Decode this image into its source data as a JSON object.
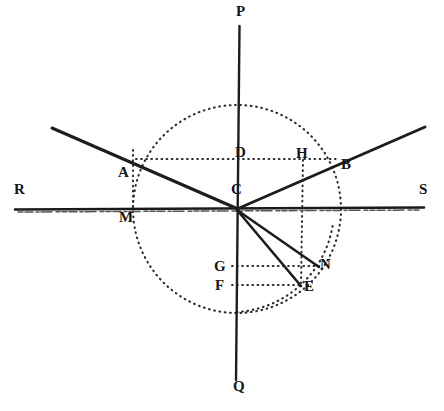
{
  "figure": {
    "type": "optics-geometry-diagram",
    "title": "",
    "canvas": {
      "width": 444,
      "height": 411,
      "background": "#ffffff"
    },
    "colors": {
      "ink": "#1a1a1a",
      "solid_line": "#1d1d1d",
      "dotted_line": "#2a2a2a",
      "surface": "#1a1a1a"
    },
    "points": {
      "C": {
        "x": 237,
        "y": 209,
        "label": "C",
        "label_x": 232,
        "label_y": 183
      },
      "P": {
        "x": 239,
        "y": 25,
        "label": "P",
        "label_x": 236,
        "label_y": 6
      },
      "Q": {
        "x": 236,
        "y": 380,
        "label": "Q",
        "label_x": 233,
        "label_y": 381
      },
      "R": {
        "x": 15,
        "y": 209,
        "label": "R",
        "label_x": 14,
        "label_y": 183
      },
      "S": {
        "x": 424,
        "y": 207,
        "label": "S",
        "label_x": 420,
        "label_y": 183
      },
      "A": {
        "x": 133,
        "y": 162,
        "label": "A",
        "label_x": 119,
        "label_y": 166
      },
      "B": {
        "x": 337,
        "y": 160,
        "label": "B",
        "label_x": 341,
        "label_y": 158
      },
      "D": {
        "x": 237,
        "y": 158,
        "label": "D",
        "label_x": 236,
        "label_y": 146
      },
      "H": {
        "x": 303,
        "y": 158,
        "label": "H",
        "label_x": 296,
        "label_y": 147
      },
      "M": {
        "x": 133,
        "y": 209,
        "label": "M",
        "label_x": 120,
        "label_y": 211
      },
      "G": {
        "x": 237,
        "y": 266,
        "label": "G",
        "label_x": 215,
        "label_y": 261
      },
      "F": {
        "x": 237,
        "y": 285,
        "label": "F",
        "label_x": 216,
        "label_y": 280
      },
      "N": {
        "x": 318,
        "y": 266,
        "label": "N",
        "label_x": 321,
        "label_y": 258
      },
      "E": {
        "x": 300,
        "y": 285,
        "label": "E",
        "label_x": 305,
        "label_y": 281
      }
    },
    "labels": [
      {
        "name": "point-label-P",
        "text": "P"
      },
      {
        "name": "point-label-Q",
        "text": "Q"
      },
      {
        "name": "point-label-R",
        "text": "R"
      },
      {
        "name": "point-label-S",
        "text": "S"
      },
      {
        "name": "point-label-A",
        "text": "A"
      },
      {
        "name": "point-label-B",
        "text": "B"
      },
      {
        "name": "point-label-C",
        "text": "C"
      },
      {
        "name": "point-label-D",
        "text": "D"
      },
      {
        "name": "point-label-E",
        "text": "E"
      },
      {
        "name": "point-label-F",
        "text": "F"
      },
      {
        "name": "point-label-G",
        "text": "G"
      },
      {
        "name": "point-label-H",
        "text": "H"
      },
      {
        "name": "point-label-M",
        "text": "M"
      },
      {
        "name": "point-label-N",
        "text": "N"
      }
    ],
    "elements": {
      "normal_axis": "P-Q vertical normal through C",
      "surface_axis": "R-S horizontal interface through C",
      "incident_ray": "from upper-left through A to C",
      "reflected_ray": "from C through B to upper-right",
      "refracted_ray_1": "C to N",
      "refracted_ray_2": "C to E",
      "circle_upper": "dotted circle centred on C radius 104",
      "arc_lower": "dotted arc through E below the surface",
      "construction_AM": "dotted vertical A to M",
      "construction_DH": "dotted horizontal D to H to B",
      "construction_HE": "dotted vertical H down through N level to E",
      "construction_GN": "dotted horizontal G to N",
      "construction_FE": "dotted horizontal F to E"
    }
  }
}
